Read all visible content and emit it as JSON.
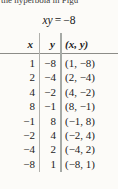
{
  "page": {
    "clipped_text": "the hyperbola in Figu",
    "equation": {
      "lhs": "xy",
      "rel": "=",
      "rhs": "−8"
    }
  },
  "table": {
    "headers": [
      "x",
      "y",
      "(x, y)"
    ],
    "rows": [
      [
        "1",
        "−8",
        "(1, −8)"
      ],
      [
        "2",
        "−4",
        "(2, −4)"
      ],
      [
        "4",
        "−2",
        "(4, −2)"
      ],
      [
        "8",
        "−1",
        "(8, −1)"
      ],
      [
        "−1",
        "8",
        "(−1, 8)"
      ],
      [
        "−2",
        "4",
        "(−2, 4)"
      ],
      [
        "−4",
        "2",
        "(−4, 2)"
      ],
      [
        "−8",
        "1",
        "(−8, 1)"
      ]
    ]
  },
  "colors": {
    "text": "#1c1c1c",
    "header_rule": "#8c8c88",
    "column_divider": "#a6aaa6",
    "background": "#fcfbf8"
  }
}
